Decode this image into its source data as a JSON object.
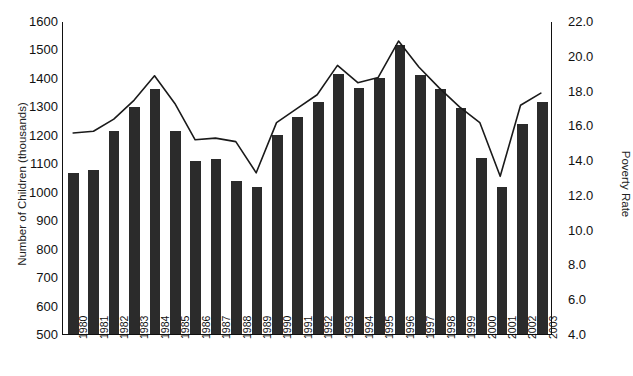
{
  "chart_data": {
    "type": "bar",
    "title": "",
    "xlabel": "",
    "ylabel": "Number of Children (thousands)",
    "y2label": "Poverty Rate",
    "grid": false,
    "legend": "none",
    "ylim": [
      500,
      1600
    ],
    "y2lim": [
      4.0,
      22.0
    ],
    "y_ticks": [
      "1600",
      "1500",
      "1400",
      "1300",
      "1200",
      "1100",
      "1000",
      "900",
      "800",
      "700",
      "600",
      "500"
    ],
    "y2_ticks": [
      "22.0",
      "20.0",
      "18.0",
      "16.0",
      "14.0",
      "12.0",
      "10.0",
      "8.0",
      "6.0",
      "4.0"
    ],
    "categories": [
      "1980",
      "1981",
      "1982",
      "1983",
      "1984",
      "1985",
      "1986",
      "1987",
      "1988",
      "1989",
      "1990",
      "1991",
      "1992",
      "1993",
      "1994",
      "1995",
      "1996",
      "1997",
      "1998",
      "1999",
      "2000",
      "2001",
      "2002",
      "2003"
    ],
    "series": [
      {
        "name": "Number of Children (thousands)",
        "kind": "bar",
        "axis": "left",
        "color": "#2b2b2b",
        "values": [
          1065,
          1075,
          1215,
          1298,
          1360,
          1213,
          1107,
          1115,
          1038,
          1015,
          1200,
          1263,
          1315,
          1415,
          1365,
          1400,
          1515,
          1412,
          1360,
          1295,
          1118,
          1018,
          1238,
          1315
        ]
      },
      {
        "name": "Poverty Rate",
        "kind": "line",
        "axis": "right",
        "color": "#1a1a1a",
        "values": [
          15.6,
          15.7,
          16.4,
          17.5,
          18.9,
          17.3,
          15.2,
          15.3,
          15.1,
          13.3,
          16.2,
          17.0,
          17.8,
          19.5,
          18.5,
          18.8,
          20.9,
          19.4,
          18.2,
          17.1,
          16.2,
          13.1,
          17.2,
          17.9
        ]
      }
    ]
  }
}
